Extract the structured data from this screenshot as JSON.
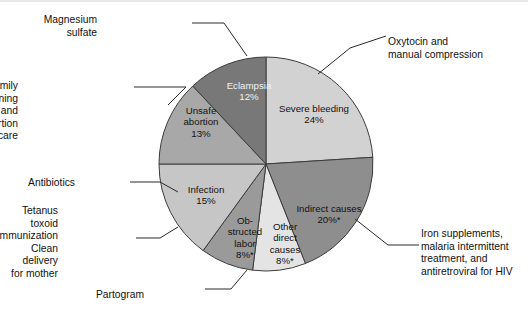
{
  "chart_data": {
    "type": "pie",
    "title": "",
    "total": 100,
    "units": "percent",
    "legend_position": "callout-labels",
    "note": "Asterisk (*) marks categories flagged in the source figure",
    "categories": [
      "Severe bleeding",
      "Indirect causes",
      "Other direct causes",
      "Obstructed labor",
      "Infection",
      "Unsafe abortion",
      "Eclampsia"
    ],
    "values": [
      24,
      20,
      8,
      8,
      15,
      13,
      12
    ],
    "slices": [
      {
        "id": "severe-bleeding",
        "label": "Severe bleeding",
        "value": 24,
        "value_text": "24%",
        "start_angle": 0,
        "end_angle": 86.4,
        "color": "#d2d2d2",
        "label_color": "dark",
        "label_x": 314,
        "label_y": 112,
        "annotation": "Oxytocin and\nmanual compression",
        "annotation_side": "right",
        "annotation_x": 388,
        "annotation_y": 36
      },
      {
        "id": "indirect-causes",
        "label": "Indirect causes",
        "value": 20,
        "value_text": "20%*",
        "start_angle": 86.4,
        "end_angle": 158.4,
        "color": "#8e8e8e",
        "label_color": "dark",
        "label_x": 329,
        "label_y": 212,
        "annotation": "Iron supplements,\nmalaria intermittent\ntreatment, and\nantiretroviral for HIV",
        "annotation_side": "right",
        "annotation_x": 421,
        "annotation_y": 228
      },
      {
        "id": "other-direct-causes",
        "label": "Other\ndirect\ncauses",
        "value": 8,
        "value_text": "8%*",
        "start_angle": 158.4,
        "end_angle": 187.2,
        "color": "#e4e4e4",
        "label_color": "dark",
        "label_x": 285,
        "label_y": 230,
        "annotation": "",
        "annotation_side": "none",
        "annotation_x": 0,
        "annotation_y": 0
      },
      {
        "id": "obstructed-labor",
        "label": "Ob-\nstructed\nlabor",
        "value": 8,
        "value_text": "8%*",
        "start_angle": 187.2,
        "end_angle": 216,
        "color": "#9a9a9a",
        "label_color": "dark",
        "label_x": 245,
        "label_y": 224,
        "annotation": "Partogram",
        "annotation_side": "left",
        "annotation_x": 144,
        "annotation_y": 289
      },
      {
        "id": "infection",
        "label": "Infection",
        "value": 15,
        "value_text": "15%",
        "start_angle": 216,
        "end_angle": 270,
        "color": "#c6c6c6",
        "label_color": "dark",
        "label_x": 206,
        "label_y": 193,
        "annotation": "Antibiotics",
        "annotation_side": "left",
        "annotation_x": 75,
        "annotation_y": 177,
        "annotation2": "Tetanus toxoid\nimmunization\nClean delivery\nfor mother",
        "annotation2_side": "left",
        "annotation2_x": 58,
        "annotation2_y": 205
      },
      {
        "id": "unsafe-abortion",
        "label": "Unsafe\nabortion",
        "value": 13,
        "value_text": "13%",
        "start_angle": 270,
        "end_angle": 316.8,
        "color": "#a8a8a8",
        "label_color": "dark",
        "label_x": 201,
        "label_y": 114,
        "annotation": "Family planning and\npostabortion care",
        "annotation_side": "left",
        "annotation_x": 18,
        "annotation_y": 80
      },
      {
        "id": "eclampsia",
        "label": "Eclampsia",
        "value": 12,
        "value_text": "12%",
        "start_angle": 316.8,
        "end_angle": 360,
        "color": "#787878",
        "label_color": "light",
        "label_x": 249,
        "label_y": 89,
        "annotation": "Magnesium\nsulfate",
        "annotation_side": "left",
        "annotation_x": 97,
        "annotation_y": 14
      }
    ],
    "leader_lines": [
      {
        "id": "oxytocin-leader",
        "points": "386,36 350,48 318,74"
      },
      {
        "id": "iron-leader",
        "points": "419,245 388,245 355,219"
      },
      {
        "id": "partogram-leader",
        "points": "205,289 231,289 247,270"
      },
      {
        "id": "antibiotics-leader",
        "points": "130,182 160,182 178,192"
      },
      {
        "id": "tetanus-leader",
        "points": "136,238 160,238 178,227"
      },
      {
        "id": "family-leader",
        "points": "186,87 134,87"
      },
      {
        "id": "family-leader2",
        "points": "186,87 168,105"
      },
      {
        "id": "magnesium-leader",
        "points": "192,23 224,23 247,56"
      }
    ],
    "geometry": {
      "center_x": 266,
      "center_y": 164,
      "radius": 107
    },
    "colors": {
      "background": "#ffffff",
      "outline": "#3c3c3c",
      "text": "#111111"
    }
  }
}
